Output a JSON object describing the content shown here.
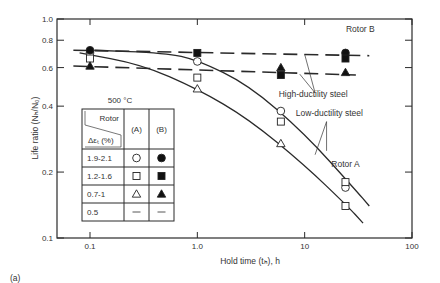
{
  "figure_label": "(a)",
  "chart_data": {
    "type": "scatter",
    "title": "",
    "xlabel": "Hold time (tₕ), h",
    "ylabel": "Life ratio (Nₕ/N₀)",
    "xscale": "log",
    "yscale": "log",
    "xlim": [
      0.1,
      100
    ],
    "ylim": [
      0.1,
      1.0
    ],
    "x_ticks": [
      0.1,
      1.0,
      10,
      100
    ],
    "x_tick_labels": [
      "0.1",
      "1.0",
      "10",
      "100"
    ],
    "y_ticks": [
      0.1,
      0.2,
      0.4,
      0.6,
      0.8,
      1.0
    ],
    "y_tick_labels": [
      "0.1",
      "0.2",
      "0.4",
      "0.6",
      "0.8",
      "1.0"
    ],
    "grid": false,
    "temperature_label": "500 °C",
    "legend": {
      "header_col1_top": "Rotor",
      "header_col1_bottom": "Δεₜ (%)",
      "header_a": "(A)",
      "header_b": "(B)",
      "rows": [
        {
          "range": "1.9-2.1",
          "a": "open-circle",
          "b": "filled-circle"
        },
        {
          "range": "1.2-1.6",
          "a": "open-square",
          "b": "filled-square"
        },
        {
          "range": "0.7-1",
          "a": "open-triangle",
          "b": "filled-triangle"
        },
        {
          "range": "0.5",
          "a": "dash",
          "b": "dash"
        }
      ]
    },
    "series": [
      {
        "name": "Rotor A, Δεt 1.9-2.1%",
        "marker": "open-circle",
        "points": [
          [
            0.1,
            0.7
          ],
          [
            1.0,
            0.64
          ],
          [
            6.0,
            0.38
          ],
          [
            24,
            0.17
          ]
        ]
      },
      {
        "name": "Rotor A, Δεt 1.2-1.6%",
        "marker": "open-square",
        "points": [
          [
            0.1,
            0.66
          ],
          [
            1.0,
            0.54
          ],
          [
            6.0,
            0.34
          ],
          [
            24,
            0.18
          ],
          [
            24,
            0.14
          ]
        ]
      },
      {
        "name": "Rotor A, Δεt 0.7-1%",
        "marker": "open-triangle",
        "points": [
          [
            1.0,
            0.48
          ],
          [
            6.0,
            0.27
          ]
        ]
      },
      {
        "name": "Rotor B, Δεt 1.9-2.1%",
        "marker": "filled-circle",
        "points": [
          [
            0.1,
            0.72
          ],
          [
            24,
            0.7
          ]
        ]
      },
      {
        "name": "Rotor B, Δεt 1.2-1.6%",
        "marker": "filled-square",
        "points": [
          [
            1.0,
            0.7
          ],
          [
            6.0,
            0.555
          ],
          [
            24,
            0.66
          ]
        ]
      },
      {
        "name": "Rotor B, Δεt 0.7-1%",
        "marker": "filled-triangle",
        "points": [
          [
            0.1,
            0.61
          ],
          [
            6.0,
            0.6
          ],
          [
            24,
            0.57
          ]
        ]
      }
    ],
    "trend_lines": [
      {
        "name": "Rotor B upper (dashed)",
        "style": "dashed",
        "points": [
          [
            0.07,
            0.72
          ],
          [
            40,
            0.68
          ]
        ]
      },
      {
        "name": "Rotor B lower (dashed)",
        "style": "dashed",
        "points": [
          [
            0.07,
            0.61
          ],
          [
            30,
            0.555
          ]
        ]
      },
      {
        "name": "Rotor A upper (solid)",
        "style": "solid",
        "points": [
          [
            0.11,
            0.72
          ],
          [
            0.5,
            0.7
          ],
          [
            1.0,
            0.65
          ],
          [
            3.0,
            0.5
          ],
          [
            10,
            0.3
          ],
          [
            30,
            0.165
          ],
          [
            40,
            0.14
          ]
        ]
      },
      {
        "name": "Rotor A lower (solid)",
        "style": "solid",
        "points": [
          [
            0.08,
            0.7
          ],
          [
            0.3,
            0.62
          ],
          [
            1.0,
            0.48
          ],
          [
            3.0,
            0.35
          ],
          [
            10,
            0.215
          ],
          [
            25,
            0.14
          ],
          [
            35,
            0.117
          ]
        ]
      }
    ],
    "annotations": [
      {
        "text": "Rotor B",
        "x": 33,
        "y": 0.87
      },
      {
        "text": "High-ductility steel",
        "x": 12,
        "y": 0.44
      },
      {
        "text": "Low-ductility steel",
        "x": 17,
        "y": 0.36
      },
      {
        "text": "Rotor A",
        "x": 24,
        "y": 0.21
      }
    ]
  }
}
